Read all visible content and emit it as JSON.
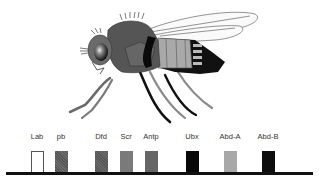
{
  "figure": {
    "genes": [
      {
        "label": "Lab",
        "x": 37,
        "fill": "#ffffff",
        "pattern": "outline"
      },
      {
        "label": "pb",
        "x": 61,
        "fill": "#5a5a5a",
        "pattern": "stipple"
      },
      {
        "label": "Dfd",
        "x": 101,
        "fill": "#5e5e5e",
        "pattern": "stipple"
      },
      {
        "label": "Scr",
        "x": 126,
        "fill": "#7a7a7a",
        "pattern": "solid"
      },
      {
        "label": "Antp",
        "x": 151,
        "fill": "#666666",
        "pattern": "solid"
      },
      {
        "label": "Ubx",
        "x": 192,
        "fill": "#080808",
        "pattern": "solid"
      },
      {
        "label": "Abd-A",
        "x": 230,
        "fill": "#a8a8a8",
        "pattern": "solid"
      },
      {
        "label": "Abd-B",
        "x": 268,
        "fill": "#0e0e0e",
        "pattern": "solid"
      }
    ]
  },
  "colors": {
    "body_dark": "#555555",
    "body_mid": "#7d7d7d",
    "body_light": "#a9a9a9",
    "black": "#0a0a0a",
    "baseline": "#111111"
  }
}
